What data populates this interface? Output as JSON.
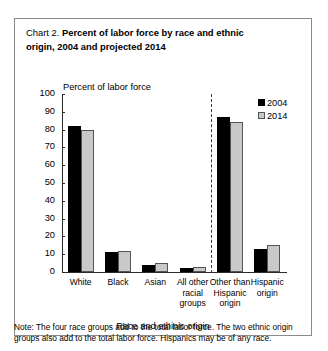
{
  "chart_data": {
    "type": "bar",
    "title_prefix": "Chart 2.",
    "title": "Percent of labor force by race and ethnic origin, 2004 and projected 2014",
    "title_line1": "Percent of labor force by race and ethnic",
    "title_line2": "origin, 2004 and projected 2014",
    "categories": [
      "White",
      "Black",
      "Asian",
      "All other racial groups",
      "Other than Hispanic origin",
      "Hispanic origin"
    ],
    "category_lines": [
      [
        "White"
      ],
      [
        "Black"
      ],
      [
        "Asian"
      ],
      [
        "All other",
        "racial",
        "groups"
      ],
      [
        "Other than",
        "Hispanic",
        "origin"
      ],
      [
        "Hispanic",
        "origin"
      ]
    ],
    "series": [
      {
        "name": "2004",
        "color": "#000000",
        "values": [
          82,
          11,
          4,
          2,
          87,
          13
        ]
      },
      {
        "name": "2014",
        "color": "#c9c9c9",
        "values": [
          80,
          12,
          5,
          3,
          84,
          15
        ]
      }
    ],
    "ylabel": "Percent of labor force",
    "xlabel": "Race and ethinic origin",
    "ylim": [
      0,
      100
    ],
    "yticks": [
      100,
      90,
      80,
      70,
      60,
      50,
      40,
      30,
      20,
      10,
      0
    ],
    "grid": false,
    "legend_position": "top-right",
    "divider_after_category_index": 3,
    "divider_style": "dashed",
    "note": "Note: The four race groups add to the total labor force. The two ethnic origin groups also add to the total labor force. Hispanics may be of any race."
  }
}
